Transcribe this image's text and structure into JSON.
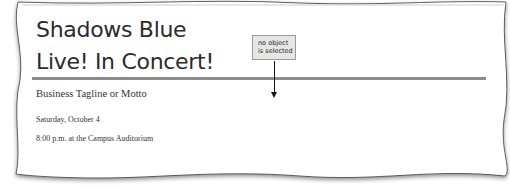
{
  "document": {
    "title_line1": "Shadows Blue",
    "title_line2": "Live! In Concert!",
    "tagline": "Business Tagline or Motto",
    "date": "Saturday, October 4",
    "time_location": "8:00 p.m. at the Campus Auditorium"
  },
  "callout": {
    "text_line1": "no object",
    "text_line2": "is selected"
  }
}
